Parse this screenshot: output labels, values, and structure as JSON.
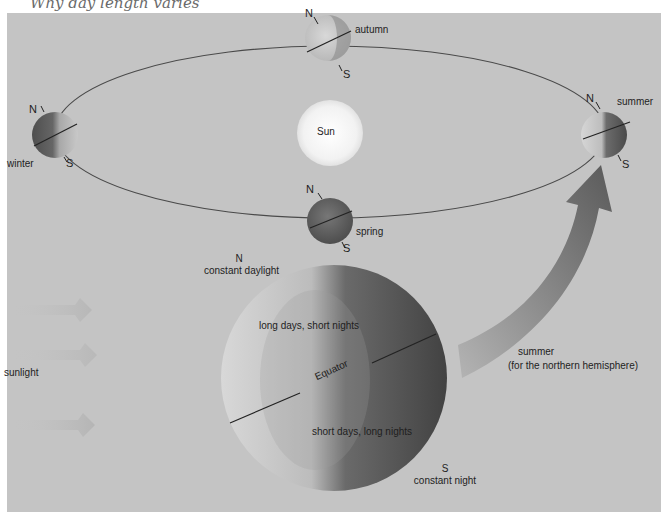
{
  "title": "Why day length varies",
  "colors": {
    "background": "#c4c4c4",
    "orbit_line": "#4a4a4a",
    "sun": "#f6f6f6",
    "globe_light": "#d2d2d2",
    "globe_dark": "#555555",
    "arrow": "#7a7a7a",
    "text": "#1e1e1e"
  },
  "orbit": {
    "sun_label": "Sun",
    "positions": [
      {
        "season": "autumn",
        "north": "N",
        "south": "S"
      },
      {
        "season": "winter",
        "north": "N",
        "south": "S"
      },
      {
        "season": "summer",
        "north": "N",
        "south": "S"
      },
      {
        "season": "spring",
        "north": "N",
        "south": "S"
      }
    ]
  },
  "large_globe": {
    "north_label": "N",
    "north_note": "constant daylight",
    "upper_note": "long days, short nights",
    "equator_label": "Equator",
    "lower_note": "short days, long nights",
    "south_label": "S",
    "south_note": "constant night"
  },
  "sunlight_label": "sunlight",
  "arrow_label": {
    "line1": "summer",
    "line2": "(for the northern hemisphere)"
  }
}
